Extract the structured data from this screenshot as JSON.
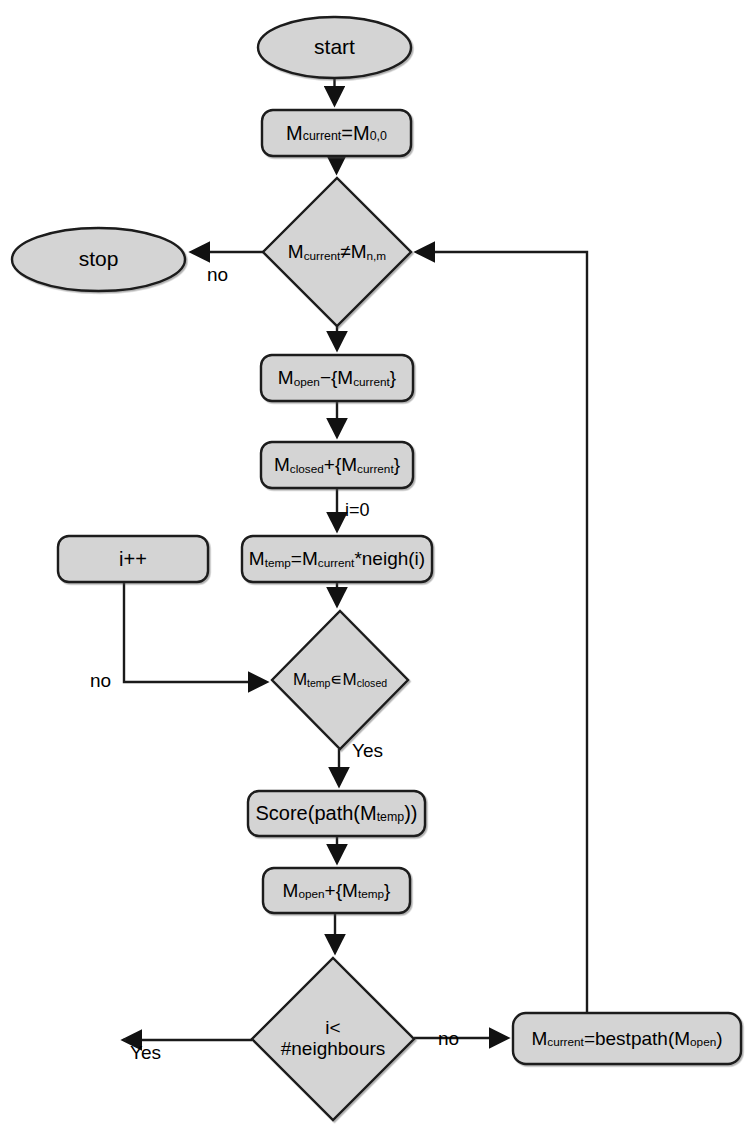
{
  "diagram": {
    "style": {
      "fill": "#d4d4d4",
      "stroke": "#1a1a1a",
      "text": "#000000",
      "background": "#ffffff"
    },
    "nodes": [
      {
        "id": "start",
        "shape": "ellipse",
        "label": "start",
        "label_html": "start",
        "x": 258,
        "y": 17,
        "w": 153,
        "h": 61,
        "font": 21
      },
      {
        "id": "init",
        "shape": "box",
        "label": "Mcurrent=M0,0",
        "label_html": "M<sub>current</sub>=M<sub>0,0</sub>",
        "x": 262,
        "y": 110,
        "w": 149,
        "h": 46,
        "font": 20
      },
      {
        "id": "goalcheck",
        "shape": "diamond",
        "label": "Mcurrent≠Mn,m",
        "label_html": "M<sub>current</sub>≠M<sub>n,m</sub>",
        "x": 263,
        "y": 178,
        "w": 148,
        "h": 148,
        "font": 19
      },
      {
        "id": "stop",
        "shape": "ellipse",
        "label": "stop",
        "label_html": "stop",
        "x": 12,
        "y": 228,
        "w": 173,
        "h": 63,
        "font": 21
      },
      {
        "id": "openremove",
        "shape": "box",
        "label": "Mopen−{Mcurrent}",
        "label_html": "M<sub>open</sub>&#8722;{M<sub>current</sub>}",
        "x": 261,
        "y": 355,
        "w": 152,
        "h": 46,
        "font": 19
      },
      {
        "id": "closedadd",
        "shape": "box",
        "label": "Mclosed+{Mcurrent}",
        "label_html": "M<sub>closed</sub>+{M<sub>current</sub>}",
        "x": 261,
        "y": 442,
        "w": 152,
        "h": 46,
        "font": 19
      },
      {
        "id": "iplusplus",
        "shape": "box",
        "label": "i++",
        "label_html": "i++",
        "x": 58,
        "y": 536,
        "w": 150,
        "h": 46,
        "font": 20
      },
      {
        "id": "mtemp",
        "shape": "box",
        "label": "Mtemp=Mcurrent*neigh(i)",
        "label_html": "M<sub>temp</sub>=M<sub>current</sub>*neigh(i)",
        "x": 242,
        "y": 536,
        "w": 190,
        "h": 46,
        "font": 19
      },
      {
        "id": "closedcheck",
        "shape": "diamond",
        "label": "Mtemp∈Mclosed",
        "label_html": "M<sub>temp</sub>&#8714;M<sub>closed</sub>",
        "x": 272,
        "y": 611,
        "w": 136,
        "h": 138,
        "font": 17
      },
      {
        "id": "score",
        "shape": "box",
        "label": "Score(path(Mtemp))",
        "label_html": "Score(path(M<sub>temp</sub>))",
        "x": 248,
        "y": 791,
        "w": 177,
        "h": 45,
        "font": 20
      },
      {
        "id": "openadd",
        "shape": "box",
        "label": "Mopen+{Mtemp}",
        "label_html": "M<sub>open</sub>+{M<sub>temp</sub>}",
        "x": 263,
        "y": 868,
        "w": 147,
        "h": 45,
        "font": 19
      },
      {
        "id": "loopcheck",
        "shape": "diamond",
        "label": "i< #neighbours",
        "label_html": "i&lt;<br>#neighbours",
        "x": 252,
        "y": 958,
        "w": 162,
        "h": 162,
        "font": 19
      },
      {
        "id": "bestpath",
        "shape": "box",
        "label": "Mcurrent=bestpath(Mopen)",
        "label_html": "M<sub>current</sub>=bestpath(M<sub>open</sub>)",
        "x": 513,
        "y": 1013,
        "w": 228,
        "h": 51,
        "font": 19
      }
    ],
    "edges": [
      {
        "id": "e-start-init",
        "from": "start",
        "to": "init",
        "label": "",
        "label_x": 0,
        "label_y": 0
      },
      {
        "id": "e-init-goalcheck",
        "from": "init",
        "to": "goalcheck",
        "label": "",
        "label_x": 0,
        "label_y": 0
      },
      {
        "id": "e-goalcheck-stop",
        "from": "goalcheck",
        "to": "stop",
        "label": "no",
        "label_x": 207,
        "label_y": 264
      },
      {
        "id": "e-goalcheck-openremove",
        "from": "goalcheck",
        "to": "openremove",
        "label": "",
        "label_x": 0,
        "label_y": 0
      },
      {
        "id": "e-openremove-closedadd",
        "from": "openremove",
        "to": "closedadd",
        "label": "",
        "label_x": 0,
        "label_y": 0
      },
      {
        "id": "e-closedadd-mtemp",
        "from": "closedadd",
        "to": "mtemp",
        "label": "i=0",
        "label_x": 345,
        "label_y": 500
      },
      {
        "id": "e-mtemp-closedcheck",
        "from": "mtemp",
        "to": "closedcheck",
        "label": "",
        "label_x": 0,
        "label_y": 0
      },
      {
        "id": "e-iplusplus-closedcheck",
        "from": "i++",
        "to": "closedcheck",
        "label": "no",
        "label_x": 90,
        "label_y": 670
      },
      {
        "id": "e-closedcheck-score",
        "from": "closedcheck",
        "to": "score",
        "label": "Yes",
        "label_x": 352,
        "label_y": 752
      },
      {
        "id": "e-score-openadd",
        "from": "score",
        "to": "openadd",
        "label": "",
        "label_x": 0,
        "label_y": 0
      },
      {
        "id": "e-openadd-loopcheck",
        "from": "openadd",
        "to": "loopcheck",
        "label": "",
        "label_x": 0,
        "label_y": 0
      },
      {
        "id": "e-loopcheck-iplusplus",
        "from": "loopcheck",
        "to": "i++",
        "label": "Yes",
        "label_x": 130,
        "label_y": 1053
      },
      {
        "id": "e-loopcheck-bestpath",
        "from": "loopcheck",
        "to": "bestpath",
        "label": "no",
        "label_x": 443,
        "label_y": 1030
      },
      {
        "id": "e-bestpath-goalcheck",
        "from": "bestpath",
        "to": "goalcheck",
        "label": "",
        "label_x": 0,
        "label_y": 0
      }
    ]
  }
}
